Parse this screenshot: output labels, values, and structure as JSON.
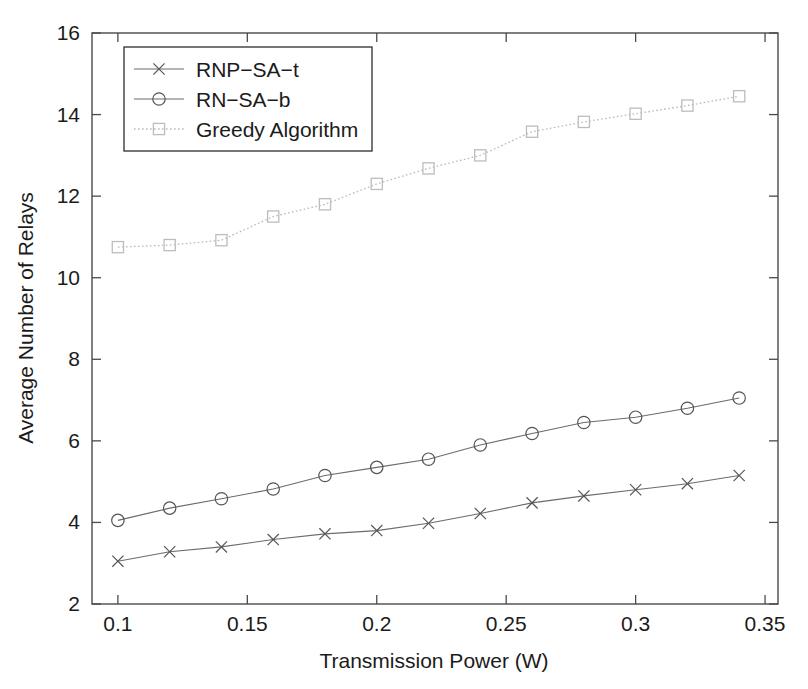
{
  "chart_data": {
    "type": "line",
    "title": "",
    "xlabel": "Transmission Power (W)",
    "ylabel": "Average Number of Relays",
    "xlim": [
      0.09,
      0.355
    ],
    "ylim": [
      2,
      16
    ],
    "xticks": [
      "0.1",
      "0.15",
      "0.2",
      "0.25",
      "0.3",
      "0.35"
    ],
    "xtick_values": [
      0.1,
      0.15,
      0.2,
      0.25,
      0.3,
      0.35
    ],
    "yticks": [
      "2",
      "4",
      "6",
      "8",
      "10",
      "12",
      "14",
      "16"
    ],
    "ytick_values": [
      2,
      4,
      6,
      8,
      10,
      12,
      14,
      16
    ],
    "grid": false,
    "legend_position": "upper-left",
    "x": [
      0.1,
      0.12,
      0.14,
      0.16,
      0.18,
      0.2,
      0.22,
      0.24,
      0.26,
      0.28,
      0.3,
      0.32,
      0.34
    ],
    "series": [
      {
        "name": "RNP-SA-t",
        "marker": "x",
        "linestyle": "solid",
        "values": [
          3.05,
          3.28,
          3.4,
          3.58,
          3.72,
          3.8,
          3.98,
          4.22,
          4.48,
          4.65,
          4.8,
          4.95,
          5.15
        ]
      },
      {
        "name": "RN-SA-b",
        "marker": "circle",
        "linestyle": "solid",
        "values": [
          4.05,
          4.35,
          4.58,
          4.82,
          5.15,
          5.35,
          5.55,
          5.9,
          6.18,
          6.45,
          6.58,
          6.8,
          7.05
        ]
      },
      {
        "name": "Greedy Algorithm",
        "marker": "square",
        "linestyle": "dotted",
        "values": [
          10.75,
          10.8,
          10.92,
          11.5,
          11.8,
          12.3,
          12.68,
          13.0,
          13.58,
          13.82,
          14.02,
          14.22,
          14.45
        ]
      }
    ]
  },
  "legend": {
    "items": [
      {
        "label": "RNP−SA−t"
      },
      {
        "label": "RN−SA−b"
      },
      {
        "label": "Greedy Algorithm"
      }
    ]
  },
  "colors": {
    "background": "#ffffff",
    "axis": "#4a4a4a",
    "series_solid": "#6b6b6b",
    "series_dotted": "#bdbdbd",
    "text": "#1b1b1b"
  }
}
